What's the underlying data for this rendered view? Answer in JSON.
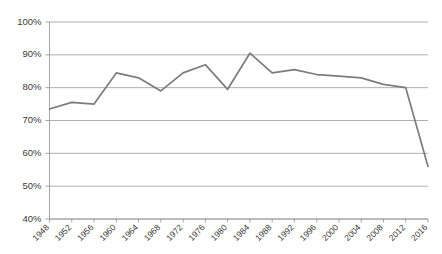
{
  "chart_data": {
    "type": "line",
    "title": "",
    "subtitle": "",
    "xlabel": "",
    "ylabel": "",
    "grid": true,
    "legend": false,
    "legend_position": "none",
    "line_color": "#7c7c7c",
    "gridline_color": "#a6a6a6",
    "axis_color": "#9a9a9a",
    "background_color": "#ffffff",
    "categories": [
      "1948",
      "1952",
      "1956",
      "1960",
      "1964",
      "1968",
      "1972",
      "1976",
      "1980",
      "1984",
      "1988",
      "1992",
      "1996",
      "2000",
      "2004",
      "2008",
      "2012",
      "2016"
    ],
    "values": [
      73.5,
      75.5,
      75.0,
      84.5,
      83.0,
      79.0,
      84.5,
      87.0,
      79.5,
      90.5,
      84.5,
      85.5,
      84.0,
      83.5,
      83.0,
      81.0,
      80.0,
      56.0
    ],
    "value_suffix": "%",
    "ylim": [
      40,
      100
    ],
    "ytick_values": [
      40,
      50,
      60,
      70,
      80,
      90,
      100
    ],
    "ytick_labels": [
      "40%",
      "50%",
      "60%",
      "70%",
      "80%",
      "90%",
      "100%"
    ],
    "xtick_labels": [
      "1948",
      "1952",
      "1956",
      "1960",
      "1964",
      "1968",
      "1972",
      "1976",
      "1980",
      "1984",
      "1988",
      "1992",
      "1996",
      "2000",
      "2004",
      "2008",
      "2012",
      "2016"
    ],
    "xtick_rotation": -45
  }
}
